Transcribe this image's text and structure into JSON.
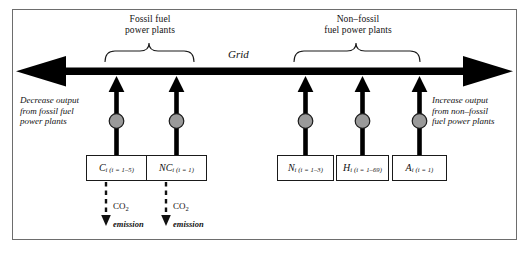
{
  "figure": {
    "title_grid": "Grid",
    "group_left": {
      "line1": "Fossil fuel",
      "line2": "power plants"
    },
    "group_right": {
      "line1": "Non–fossil",
      "line2": "fuel power plants"
    },
    "note_left": {
      "line1": "Decrease output",
      "line2": "from fossil fuel",
      "line3": "power plants"
    },
    "note_right": {
      "line1": "Increase output",
      "line2": "from non–fossil",
      "line3": "fuel power plants"
    },
    "plants": [
      {
        "symbol": "C",
        "index": "i",
        "range": "(i = 1–5)",
        "group": "fossil",
        "emits_co2": true
      },
      {
        "symbol": "NC",
        "index": "i",
        "range": "(i = 1)",
        "group": "fossil",
        "emits_co2": true
      },
      {
        "symbol": "N",
        "index": "i",
        "range": "(i = 1–3)",
        "group": "non-fossil",
        "emits_co2": false
      },
      {
        "symbol": "H",
        "index": "i",
        "range": "(i = 1–69)",
        "group": "non-fossil",
        "emits_co2": false
      },
      {
        "symbol": "A",
        "index": "i",
        "range": "(i = 1)",
        "group": "non-fossil",
        "emits_co2": false
      }
    ],
    "emission": {
      "label": "CO",
      "subscript": "2",
      "caption": "emission"
    },
    "colors": {
      "frame": "#6d6d6d",
      "arrow": "#000000",
      "node_fill": "#9a9a9a",
      "node_stroke": "#1a1a1a",
      "box_stroke": "#1a1a1a",
      "text": "#111111"
    }
  }
}
